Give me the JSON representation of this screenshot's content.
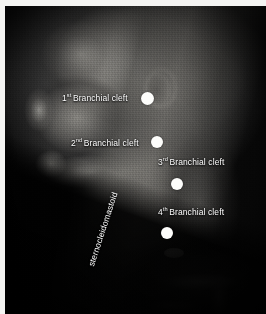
{
  "figure": {
    "modality": "3D CT reconstruction, lateral head and neck",
    "background_color": "#ffffff",
    "image_background_color": "#000000",
    "marker_color": "#fdfdfb",
    "label_color": "#ffffff"
  },
  "annotations": [
    {
      "id": "branchial-cleft-1",
      "ordinal": "1",
      "ordinal_suffix": "st",
      "text": "Branchial cleft",
      "full_text": "1st Branchial cleft",
      "label_x": 57,
      "label_y": 92,
      "marker_x": 142,
      "marker_y": 92,
      "marker_size": 13
    },
    {
      "id": "branchial-cleft-2",
      "ordinal": "2",
      "ordinal_suffix": "nd",
      "text": "Branchial cleft",
      "full_text": "2nd Branchial cleft",
      "label_x": 66,
      "label_y": 137,
      "marker_x": 152,
      "marker_y": 136,
      "marker_size": 12
    },
    {
      "id": "branchial-cleft-3",
      "ordinal": "3",
      "ordinal_suffix": "rd",
      "text": "Branchial cleft",
      "full_text": "3rd Branchial cleft",
      "label_x": 157,
      "label_y": 156,
      "marker_x": 172,
      "marker_y": 178,
      "marker_size": 12
    },
    {
      "id": "branchial-cleft-4",
      "ordinal": "4",
      "ordinal_suffix": "th",
      "text": "Branchial cleft",
      "full_text": "4th Branchial cleft",
      "label_x": 157,
      "label_y": 206,
      "marker_x": 162,
      "marker_y": 227,
      "marker_size": 12
    }
  ],
  "muscle_label": {
    "id": "sternocleidomastoid",
    "text": "sternocleidomastoid",
    "rotation_deg": -72
  }
}
